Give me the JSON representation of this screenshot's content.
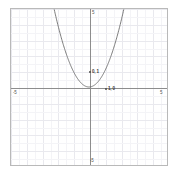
{
  "chart_data": {
    "type": "line",
    "title": "",
    "xlabel": "",
    "ylabel": "",
    "xlim": [
      -5,
      5
    ],
    "ylim": [
      -5,
      5
    ],
    "grid": true,
    "legend_position": "none",
    "function": "y = x^2",
    "x": [
      -2.5,
      -2.25,
      -2,
      -1.75,
      -1.5,
      -1.25,
      -1,
      -0.75,
      -0.5,
      -0.25,
      0,
      0.25,
      0.5,
      0.75,
      1,
      1.25,
      1.5,
      1.75,
      2,
      2.25,
      2.5
    ],
    "values": [
      6.25,
      5.0625,
      4,
      3.0625,
      2.25,
      1.5625,
      1,
      0.5625,
      0.25,
      0.0625,
      0,
      0.0625,
      0.25,
      0.5625,
      1,
      1.5625,
      2.25,
      3.0625,
      4,
      5.0625,
      6.25
    ],
    "series": [
      {
        "name": "y = x^2",
        "color": "#6b6b6b",
        "values": [
          6.25,
          5.0625,
          4,
          3.0625,
          2.25,
          1.5625,
          1,
          0.5625,
          0.25,
          0.0625,
          0,
          0.0625,
          0.25,
          0.5625,
          1,
          1.5625,
          2.25,
          3.0625,
          4,
          5.0625,
          6.25
        ]
      }
    ],
    "annotations": [
      {
        "id": "vertex-upper-label",
        "text": "0, 1",
        "x": 0,
        "y": 1
      },
      {
        "id": "origin-label",
        "text": "1, 0",
        "x": 1,
        "y": 0
      }
    ],
    "axis_end_labels": [
      {
        "id": "x-min",
        "text": "-5"
      },
      {
        "id": "x-max",
        "text": "5"
      },
      {
        "id": "y-max",
        "text": "5"
      },
      {
        "id": "y-min",
        "text": "-5"
      }
    ],
    "colors": {
      "curve": "#6b6b6b",
      "axis": "#8d8d8d",
      "grid_major": "#e9e9ee",
      "grid_minor": "#f4f4f7",
      "frame": "#b9b9b9",
      "background": "#ffffff",
      "label": "#555555"
    }
  }
}
